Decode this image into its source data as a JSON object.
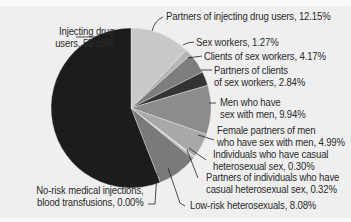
{
  "chart_data": {
    "type": "pie",
    "title": "",
    "start_angle": "12 o'clock",
    "direction": "clockwise",
    "slices": [
      {
        "label": "Partners of injecting drug users",
        "value": 12.15,
        "color": "#c9c9c9"
      },
      {
        "label": "Sex workers",
        "value": 1.27,
        "color": "#b5b5b5"
      },
      {
        "label": "Clients of sex workers",
        "value": 4.17,
        "color": "#7d7d7d"
      },
      {
        "label": "Partners of clients of sex workers",
        "value": 2.84,
        "color": "#333333"
      },
      {
        "label": "Men who have sex with men",
        "value": 9.94,
        "color": "#8c8c8c"
      },
      {
        "label": "Female partners of men who have sex with men",
        "value": 4.99,
        "color": "#a8a8a8"
      },
      {
        "label": "Individuals who have casual heterosexual sex",
        "value": 0.3,
        "color": "#d8d8d8"
      },
      {
        "label": "Partners of individuals who have casual heterosexual sex",
        "value": 0.32,
        "color": "#9a9a9a"
      },
      {
        "label": "Low-risk heterosexuals",
        "value": 8.08,
        "color": "#7a7a7a"
      },
      {
        "label": "No-risk medical injections, blood transfusions",
        "value": 0.0,
        "color": "#555555"
      },
      {
        "label": "Injecting drug users",
        "value": 55.95,
        "color": "#1c1c1c"
      }
    ]
  },
  "labels": {
    "idu": [
      "Injecting drug",
      "users, 55.95%"
    ],
    "partners_idu": [
      "Partners of injecting drug users, 12.15%"
    ],
    "sex_workers": [
      "Sex workers, 1.27%"
    ],
    "clients": [
      "Clients of sex workers, 4.17%"
    ],
    "partners_clients": [
      "Partners of clients",
      "of sex workers, 2.84%"
    ],
    "msm": [
      "Men who have",
      "sex with men, 9.94%"
    ],
    "female_msm": [
      "Female partners of men",
      "who have sex with men, 4.99%"
    ],
    "casual": [
      "Individuals who have casual",
      "heterosexual sex, 0.30%"
    ],
    "partners_casual": [
      "Partners of individuals who have",
      "casual heterosexual sex, 0.32%"
    ],
    "low_risk": [
      "Low-risk heterosexuals, 8.08%"
    ],
    "no_risk": [
      "No-risk medical injections,",
      "blood transfusions, 0.00%"
    ]
  }
}
